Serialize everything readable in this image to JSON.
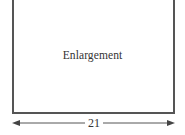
{
  "figure": {
    "shape_label": "Enlargement",
    "dimension": {
      "label": "21",
      "orientation": "horizontal",
      "arrowheads": "both"
    },
    "colors": {
      "stroke": "#555555",
      "text": "#333333",
      "background": "#ffffff"
    }
  }
}
